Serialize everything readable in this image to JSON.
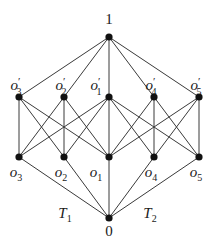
{
  "diagram": {
    "type": "lattice",
    "colors": {
      "edge": "#3a3a3a",
      "node": "#111111",
      "text": "#1a1a1a",
      "background": "#ffffff"
    },
    "nodes": [
      {
        "id": "top",
        "label": "1",
        "x": 109,
        "y": 37,
        "label_x": 109,
        "label_y": 24
      },
      {
        "id": "o3p",
        "label": "o",
        "sub": "3",
        "prime": true,
        "x": 19,
        "y": 97,
        "label_x": 16,
        "label_y": 90
      },
      {
        "id": "o2p",
        "label": "o",
        "sub": "2",
        "prime": true,
        "x": 64,
        "y": 97,
        "label_x": 61,
        "label_y": 90
      },
      {
        "id": "o1p",
        "label": "o",
        "sub": "1",
        "prime": true,
        "x": 109,
        "y": 97,
        "label_x": 96,
        "label_y": 90
      },
      {
        "id": "o4p",
        "label": "o",
        "sub": "4",
        "prime": true,
        "x": 154,
        "y": 97,
        "label_x": 151,
        "label_y": 90
      },
      {
        "id": "o5p",
        "label": "o",
        "sub": "5",
        "prime": true,
        "x": 199,
        "y": 97,
        "label_x": 196,
        "label_y": 90
      },
      {
        "id": "o3",
        "label": "o",
        "sub": "3",
        "prime": false,
        "x": 19,
        "y": 157,
        "label_x": 16,
        "label_y": 177
      },
      {
        "id": "o2",
        "label": "o",
        "sub": "2",
        "prime": false,
        "x": 64,
        "y": 157,
        "label_x": 61,
        "label_y": 177
      },
      {
        "id": "o1",
        "label": "o",
        "sub": "1",
        "prime": false,
        "x": 109,
        "y": 157,
        "label_x": 96,
        "label_y": 177
      },
      {
        "id": "o4",
        "label": "o",
        "sub": "4",
        "prime": false,
        "x": 154,
        "y": 157,
        "label_x": 151,
        "label_y": 177
      },
      {
        "id": "o5",
        "label": "o",
        "sub": "5",
        "prime": false,
        "x": 199,
        "y": 157,
        "label_x": 196,
        "label_y": 177
      },
      {
        "id": "bottom",
        "label": "0",
        "x": 109,
        "y": 218,
        "label_x": 109,
        "label_y": 236
      }
    ],
    "edges": [
      [
        "top",
        "o3p"
      ],
      [
        "top",
        "o2p"
      ],
      [
        "top",
        "o1p"
      ],
      [
        "top",
        "o4p"
      ],
      [
        "top",
        "o5p"
      ],
      [
        "o3p",
        "o3"
      ],
      [
        "o3p",
        "o2"
      ],
      [
        "o3p",
        "o1"
      ],
      [
        "o2p",
        "o3"
      ],
      [
        "o2p",
        "o2"
      ],
      [
        "o2p",
        "o1"
      ],
      [
        "o1p",
        "o3"
      ],
      [
        "o1p",
        "o2"
      ],
      [
        "o1p",
        "o1"
      ],
      [
        "o1p",
        "o4"
      ],
      [
        "o1p",
        "o5"
      ],
      [
        "o4p",
        "o1"
      ],
      [
        "o4p",
        "o4"
      ],
      [
        "o4p",
        "o5"
      ],
      [
        "o5p",
        "o1"
      ],
      [
        "o5p",
        "o4"
      ],
      [
        "o5p",
        "o5"
      ],
      [
        "o3",
        "bottom"
      ],
      [
        "o2",
        "bottom"
      ],
      [
        "o1",
        "bottom"
      ],
      [
        "o4",
        "bottom"
      ],
      [
        "o5",
        "bottom"
      ]
    ],
    "region_labels": [
      {
        "text": "T",
        "sub": "1",
        "x": 65,
        "y": 218
      },
      {
        "text": "T",
        "sub": "2",
        "x": 150,
        "y": 218
      }
    ]
  }
}
